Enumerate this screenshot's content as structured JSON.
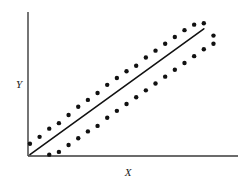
{
  "figure": {
    "background_color": "#ffffff",
    "ink_color": "#111111",
    "axis_color": "#3a3a3a"
  },
  "axes": {
    "x_label": "X",
    "y_label": "Y",
    "x_axis_name": "horizontal-axis",
    "y_axis_name": "vertical-axis",
    "origin_px": [
      28,
      156
    ],
    "x_axis_end_px": [
      238,
      156
    ],
    "y_axis_end_px": [
      28,
      12
    ],
    "ticks_visible": false,
    "grid_visible": false
  },
  "chart_data": {
    "type": "scatter",
    "title": "",
    "xlabel": "X",
    "ylabel": "Y",
    "xlim": [
      0,
      100
    ],
    "ylim": [
      0,
      100
    ],
    "grid": false,
    "legend": "none",
    "annotations": [
      "Two parallel bands of points rising linearly",
      "Straight fitted line drawn from the origin through the middle of the bands"
    ],
    "fit_line": {
      "name": "regression-line",
      "style": "solid",
      "color": "#111111",
      "width_px": 1.6,
      "x": [
        1,
        91
      ],
      "y": [
        1,
        93
      ]
    },
    "series": [
      {
        "name": "upper band",
        "marker": "filled-circle",
        "marker_size_px": 4.4,
        "color": "#111111",
        "x": [
          1,
          6,
          11,
          16,
          21,
          26,
          31,
          36,
          41,
          46,
          51,
          56,
          61,
          66,
          71,
          76,
          81,
          86,
          91,
          96
        ],
        "y": [
          9,
          14,
          20,
          24,
          30,
          36,
          41,
          46,
          52,
          57,
          62,
          66,
          72,
          77,
          82,
          87,
          92,
          96,
          97,
          88
        ]
      },
      {
        "name": "lower band",
        "marker": "filled-circle",
        "marker_size_px": 4.4,
        "color": "#111111",
        "x": [
          11,
          16,
          21,
          26,
          31,
          36,
          41,
          46,
          51,
          56,
          61,
          66,
          71,
          76,
          81,
          86,
          91,
          96
        ],
        "y": [
          1,
          3,
          8,
          13,
          18,
          22,
          28,
          33,
          38,
          43,
          48,
          53,
          58,
          63,
          68,
          73,
          78,
          82
        ]
      }
    ]
  }
}
